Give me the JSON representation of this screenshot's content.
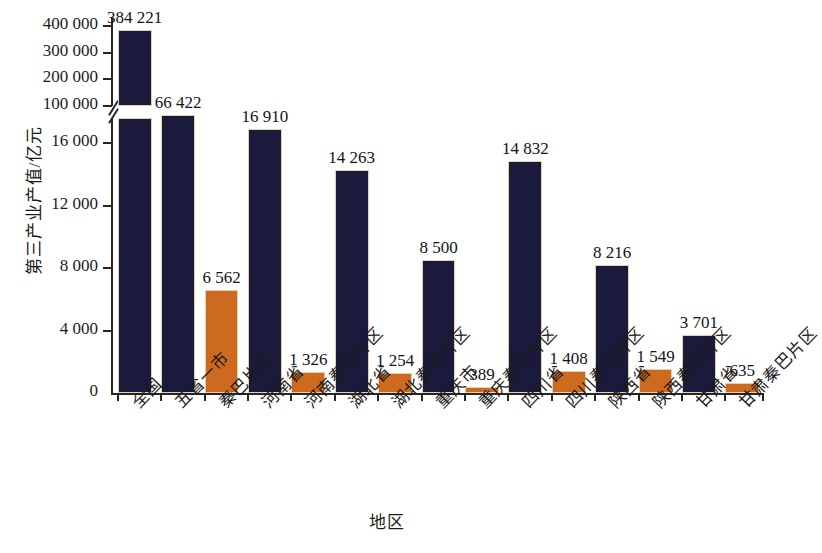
{
  "chart_data": {
    "type": "bar",
    "title": "",
    "xlabel": "地区",
    "ylabel": "第三产业产值/亿元",
    "grid": false,
    "legend": "none",
    "broken_axis": true,
    "axis_note": "Y axis is broken: lower segment 0–16 000 (ticks every 4 000), upper segment 100 000–400 000 (ticks every 100 000)",
    "lower_ticks": [
      "0",
      "4 000",
      "8 000",
      "12 000",
      "16 000"
    ],
    "lower_tick_values": [
      0,
      4000,
      8000,
      12000,
      16000
    ],
    "upper_ticks": [
      "100 000",
      "200 000",
      "300 000",
      "400 000"
    ],
    "upper_tick_values": [
      100000,
      200000,
      300000,
      400000
    ],
    "ylim_lower": [
      0,
      17600
    ],
    "ylim_upper": [
      100000,
      430000
    ],
    "categories": [
      "全国",
      "五省一市",
      "秦巴片区",
      "河南省",
      "河南秦巴片区",
      "湖北省",
      "湖北秦巴片区",
      "重庆市",
      "重庆秦巴片区",
      "四川省",
      "四川秦巴片区",
      "陕西省",
      "陕西秦巴片区",
      "甘肃省",
      "甘肃秦巴片区"
    ],
    "values": [
      384221,
      66422,
      6562,
      16910,
      1326,
      14263,
      1254,
      8500,
      389,
      14832,
      1408,
      8216,
      1549,
      3701,
      635
    ],
    "value_labels": [
      "384 221",
      "66 422",
      "6 562",
      "16 910",
      "1 326",
      "14 263",
      "1 254",
      "8 500",
      "389",
      "14 832",
      "1 408",
      "8 216",
      "1 549",
      "3 701",
      "635"
    ],
    "series_colors": {
      "province": "#191a3c",
      "qinba_area": "#cd6a20",
      "bar_outline": "#e8cfa8",
      "axis": "#262626",
      "background": "#ffffff"
    },
    "bar_colors": [
      "#191a3c",
      "#191a3c",
      "#cd6a20",
      "#191a3c",
      "#cd6a20",
      "#191a3c",
      "#cd6a20",
      "#191a3c",
      "#cd6a20",
      "#191a3c",
      "#cd6a20",
      "#191a3c",
      "#cd6a20",
      "#191a3c",
      "#cd6a20"
    ]
  }
}
